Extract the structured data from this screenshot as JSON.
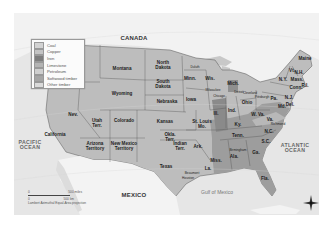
{
  "map": {
    "region_labels": {
      "canada": "CANADA",
      "mexico": "MEXICO",
      "pacific": "PACIFIC\nOCEAN",
      "atlantic": "ATLANTIC\nOCEAN",
      "gulf": "Gulf of Mexico"
    },
    "states": [
      {
        "name": "Montana",
        "x": 122,
        "y": 68
      },
      {
        "name": "North\nDakota",
        "x": 163,
        "y": 65
      },
      {
        "name": "South\nDakota",
        "x": 163,
        "y": 84
      },
      {
        "name": "Wyoming",
        "x": 122,
        "y": 93
      },
      {
        "name": "Nebraska",
        "x": 167,
        "y": 101
      },
      {
        "name": "Iowa",
        "x": 191,
        "y": 99
      },
      {
        "name": "Minn.",
        "x": 190,
        "y": 78
      },
      {
        "name": "Wis.",
        "x": 210,
        "y": 78
      },
      {
        "name": "Mich.",
        "x": 233,
        "y": 83
      },
      {
        "name": "Ill.",
        "x": 216,
        "y": 113
      },
      {
        "name": "Ind.",
        "x": 232,
        "y": 110
      },
      {
        "name": "Ohio",
        "x": 247,
        "y": 102
      },
      {
        "name": "St. Louis\nMo.",
        "x": 202,
        "y": 124
      },
      {
        "name": "Kansas",
        "x": 165,
        "y": 121
      },
      {
        "name": "Colorado",
        "x": 124,
        "y": 120
      },
      {
        "name": "Utah\nTerr.",
        "x": 97,
        "y": 123
      },
      {
        "name": "Nev.",
        "x": 73,
        "y": 114
      },
      {
        "name": "California",
        "x": 55,
        "y": 134
      },
      {
        "name": "Arizona\nTerritory",
        "x": 95,
        "y": 146
      },
      {
        "name": "New Mexico\nTerritory",
        "x": 124,
        "y": 146
      },
      {
        "name": "Okla.\nTerr.",
        "x": 170,
        "y": 137
      },
      {
        "name": "Indian\nTerr.",
        "x": 180,
        "y": 146
      },
      {
        "name": "Texas",
        "x": 166,
        "y": 166
      },
      {
        "name": "Ark.",
        "x": 198,
        "y": 146
      },
      {
        "name": "La.",
        "x": 208,
        "y": 168
      },
      {
        "name": "Miss.",
        "x": 216,
        "y": 160
      },
      {
        "name": "Ala.",
        "x": 234,
        "y": 156
      },
      {
        "name": "Ga.",
        "x": 256,
        "y": 152
      },
      {
        "name": "Fla.",
        "x": 265,
        "y": 178
      },
      {
        "name": "Tenn.",
        "x": 238,
        "y": 135
      },
      {
        "name": "Ky.",
        "x": 238,
        "y": 124
      },
      {
        "name": "W. Va.",
        "x": 258,
        "y": 114
      },
      {
        "name": "Va.",
        "x": 270,
        "y": 119
      },
      {
        "name": "N.C.",
        "x": 269,
        "y": 131
      },
      {
        "name": "S.C.",
        "x": 266,
        "y": 141
      },
      {
        "name": "Pa.",
        "x": 274,
        "y": 98
      },
      {
        "name": "N.Y.",
        "x": 283,
        "y": 79
      },
      {
        "name": "Maine",
        "x": 305,
        "y": 58
      },
      {
        "name": "Vt.",
        "x": 292,
        "y": 70
      },
      {
        "name": "N.H.",
        "x": 299,
        "y": 72
      },
      {
        "name": "Mass.",
        "x": 297,
        "y": 79
      },
      {
        "name": "R.I.",
        "x": 305,
        "y": 85
      },
      {
        "name": "Conn.",
        "x": 296,
        "y": 87
      },
      {
        "name": "N.J.",
        "x": 289,
        "y": 97
      },
      {
        "name": "Del.",
        "x": 290,
        "y": 104
      },
      {
        "name": "Md.",
        "x": 282,
        "y": 106
      },
      {
        "name": "Birmingham",
        "x": 238,
        "y": 150
      },
      {
        "name": "Beaumont",
        "x": 192,
        "y": 173
      },
      {
        "name": "Houston",
        "x": 188,
        "y": 178
      },
      {
        "name": "Pittsburgh",
        "x": 262,
        "y": 97
      },
      {
        "name": "Cleveland",
        "x": 250,
        "y": 93
      },
      {
        "name": "Chicago",
        "x": 219,
        "y": 96
      },
      {
        "name": "Milwaukee",
        "x": 213,
        "y": 90
      },
      {
        "name": "Detroit",
        "x": 239,
        "y": 92
      },
      {
        "name": "Duluth",
        "x": 195,
        "y": 67
      },
      {
        "name": "Richmond",
        "x": 278,
        "y": 124
      }
    ]
  },
  "legend": {
    "items": [
      {
        "label": "Coal",
        "color": "#d2d2d2"
      },
      {
        "label": "Copper",
        "color": "#c4c4c4"
      },
      {
        "label": "Iron",
        "color": "#7e7e7e"
      },
      {
        "label": "Limestone",
        "color": "#b4b4b4"
      },
      {
        "label": "Petroleum",
        "color": "#cfcfcf"
      },
      {
        "label": "Softwood timber",
        "color": "#a5a5a5"
      },
      {
        "label": "Other timber",
        "color": "#dadada"
      }
    ]
  },
  "scale": {
    "miles": "500 miles",
    "km": "500 km",
    "zero": "0",
    "projection": "Lambert Azimuthal Equal-Area projection"
  },
  "compass": {
    "n": "N",
    "s": "S",
    "e": "E",
    "w": "W"
  }
}
